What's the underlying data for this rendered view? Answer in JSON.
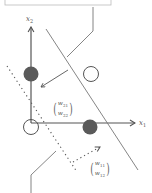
{
  "diagram": {
    "type": "linear-classifier-weight-vectors",
    "axes": {
      "x_label": "x",
      "x_sub": "1",
      "y_label": "x",
      "y_sub": "2"
    },
    "vectors": [
      {
        "name": "w2",
        "top": "w",
        "top_sub": "21",
        "bottom": "w",
        "bottom_sub": "22",
        "style": "solid"
      },
      {
        "name": "w1",
        "top": "w",
        "top_sub": "11",
        "bottom": "w",
        "bottom_sub": "12",
        "style": "dotted"
      }
    ],
    "points": [
      {
        "kind": "filled",
        "x": 0,
        "y": 1
      },
      {
        "kind": "filled",
        "x": 1,
        "y": 0
      },
      {
        "kind": "open",
        "x": 0,
        "y": 0
      },
      {
        "kind": "open",
        "x": 1,
        "y": 1
      }
    ],
    "colors": {
      "stroke": "#555555",
      "filled_point": "#5a5a5a",
      "box_border": "#bbbbbb"
    }
  }
}
